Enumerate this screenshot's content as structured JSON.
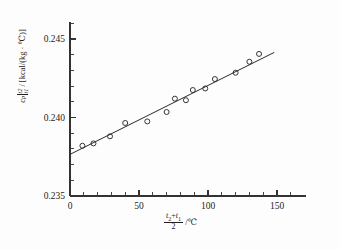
{
  "chart_data": {
    "type": "scatter",
    "title": "",
    "subtitle": "",
    "xlabel": "(t2+t1)/2 / ℃",
    "ylabel": "cp|t1..t2 / [kcal/(kg · ℃)]",
    "xlim": [
      0,
      150
    ],
    "ylim": [
      0.235,
      0.245
    ],
    "xticks": [
      0,
      50,
      100,
      150
    ],
    "xtick_labels": [
      "0",
      "50",
      "100",
      "150"
    ],
    "yticks": [
      0.235,
      0.24,
      0.245
    ],
    "ytick_labels": [
      "0.235",
      "0.240",
      "0.245"
    ],
    "x_minor_step": 10,
    "y_minor_step": 0.001,
    "grid": false,
    "legend": null,
    "x": [
      9,
      17,
      29,
      40,
      56,
      70,
      76,
      84,
      89,
      98,
      105,
      120,
      130,
      137
    ],
    "y": [
      0.2382,
      0.23835,
      0.2388,
      0.23965,
      0.23975,
      0.24035,
      0.2412,
      0.2411,
      0.24175,
      0.24185,
      0.24245,
      0.24285,
      0.24355,
      0.24405
    ],
    "series": [
      {
        "name": "measured specific heat",
        "marker": "open-circle",
        "x": [
          9,
          17,
          29,
          40,
          56,
          70,
          76,
          84,
          89,
          98,
          105,
          120,
          130,
          137
        ],
        "values": [
          0.2382,
          0.23835,
          0.2388,
          0.23965,
          0.23975,
          0.24035,
          0.2412,
          0.2411,
          0.24175,
          0.24185,
          0.24245,
          0.24285,
          0.24355,
          0.24405
        ]
      },
      {
        "name": "linear fit",
        "type": "line",
        "x": [
          0,
          148
        ],
        "values": [
          0.23765,
          0.24415
        ]
      }
    ],
    "fit": {
      "intercept": 0.23765,
      "slope": 4.39e-05,
      "x_start": 0,
      "x_end": 148
    }
  },
  "axis_titles": {
    "y": {
      "symbol": "c",
      "symbol_sub": "p",
      "limit_upper": "t2",
      "limit_lower": "t1",
      "slash": "/",
      "units": "[kcal/(kg · ℃)]"
    },
    "x": {
      "numerator_a": "t",
      "numerator_a_sub": "2",
      "plus": "+",
      "numerator_b": "t",
      "numerator_b_sub": "1",
      "denominator": "2",
      "units": "/℃"
    }
  },
  "colors": {
    "background": "#fdfdfd",
    "axis": "#333333",
    "marker_stroke": "#2b2b2b",
    "fit_line": "#2a2a2a",
    "text": "#1f1f1f"
  }
}
